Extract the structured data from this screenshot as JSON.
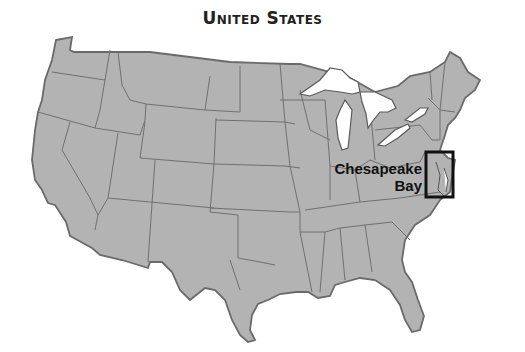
{
  "title": "United States",
  "annotation": {
    "line1": "Chesapeake",
    "line2": "Bay"
  },
  "colors": {
    "land": "#b3b3b3",
    "border": "#6a6a6a",
    "water": "#ffffff",
    "highlight_box": "#111111"
  }
}
